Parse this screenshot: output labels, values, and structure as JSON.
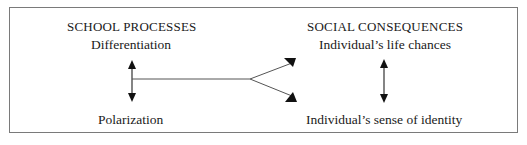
{
  "left_column": {
    "heading": "SCHOOL PROCESSES",
    "top_item": "Differentiation",
    "bottom_item": "Polarization"
  },
  "right_column": {
    "heading": "SOCIAL CONSEQUENCES",
    "top_item": "Individual’s life chances",
    "bottom_item": "Individual’s sense of identity"
  },
  "colors": {
    "line": "#333333",
    "border": "#7a7a7a",
    "text": "#1a1a1a"
  }
}
